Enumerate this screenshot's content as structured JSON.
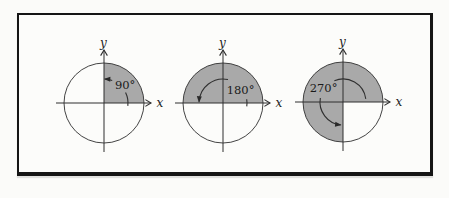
{
  "figure": {
    "background_color": "#fbfbf9",
    "frame_color": "#151515",
    "shade_color": "#a9a9a9",
    "line_color": "#2f2f2f"
  },
  "diagrams": [
    {
      "name": "angle-90",
      "angle_degrees": 90,
      "angle_label": "90°",
      "x_axis_label": "x",
      "y_axis_label": "y",
      "center": {
        "x": 104,
        "y": 103
      },
      "radius": 40,
      "arc_radius": 24,
      "arc_segments_deg": [
        [
          -7,
          26
        ],
        [
          70,
          88
        ]
      ],
      "label_pos_deg": 41,
      "label_radius": 28
    },
    {
      "name": "angle-180",
      "angle_degrees": 180,
      "angle_label": "180°",
      "x_axis_label": "x",
      "y_axis_label": "y",
      "center": {
        "x": 223,
        "y": 103
      },
      "radius": 40,
      "arc_radius": 24,
      "arc_segments_deg": [
        [
          -8,
          9
        ],
        [
          78,
          177
        ]
      ],
      "label_pos_deg": 37,
      "label_radius": 22
    },
    {
      "name": "angle-270",
      "angle_degrees": 270,
      "angle_label": "270°",
      "x_axis_label": "x",
      "y_axis_label": "y",
      "center": {
        "x": 343,
        "y": 102
      },
      "radius": 40,
      "arc_radius": 23,
      "arc_segments_deg": [
        [
          8,
          112
        ],
        [
          170,
          264
        ]
      ],
      "label_pos_deg": 144,
      "label_radius": 24
    }
  ]
}
